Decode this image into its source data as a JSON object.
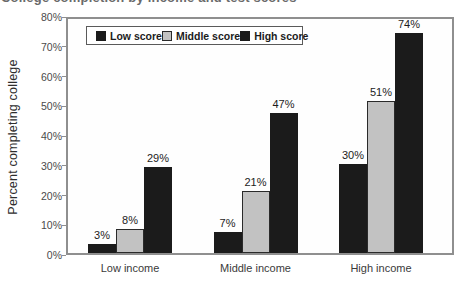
{
  "figure": {
    "cropped_title_fragment": "College completion by income and test scores",
    "background": "#ffffff",
    "frame_color": "#8f8f8f"
  },
  "chart_data": {
    "type": "bar",
    "title": "",
    "categories": [
      "Low income",
      "Middle income",
      "High income"
    ],
    "series": [
      {
        "name": "Low score",
        "color": "#1b1b1b",
        "values": [
          3,
          7,
          30
        ]
      },
      {
        "name": "Middle score",
        "color": "#c2c2c2",
        "outline": "#2a2a2a",
        "values": [
          8,
          21,
          51
        ]
      },
      {
        "name": "High score",
        "color": "#1b1b1b",
        "values": [
          29,
          47,
          74
        ]
      }
    ],
    "value_label_format": "{v}%",
    "xlabel": "",
    "ylabel": "Percent completing college",
    "ylim": [
      0,
      80
    ],
    "yticks": [
      "0%",
      "10%",
      "20%",
      "30%",
      "40%",
      "50%",
      "60%",
      "70%",
      "80%"
    ],
    "grid": false,
    "legend_position": "top-left-inside"
  }
}
